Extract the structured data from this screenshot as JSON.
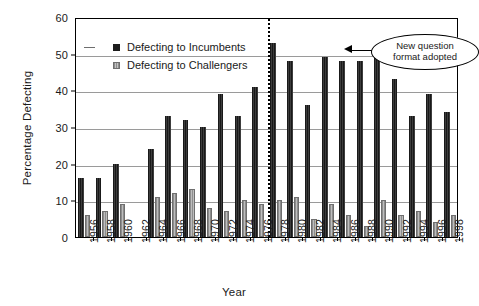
{
  "chart_data": {
    "type": "bar",
    "title": "",
    "xlabel": "Year",
    "ylabel": "Percentage Defecting",
    "ylim": [
      0,
      60
    ],
    "ytick_step": 10,
    "yticks": [
      0,
      10,
      20,
      30,
      40,
      50,
      60
    ],
    "grid": "horizontal",
    "legend_position": "inside-upper-left",
    "categories": [
      "1956",
      "1958",
      "1960",
      "1962",
      "1964",
      "1966",
      "1968",
      "1970",
      "1972",
      "1974",
      "1976",
      "1978",
      "1980",
      "1982",
      "1984",
      "1986",
      "1988",
      "1990",
      "1992",
      "1994",
      "1996",
      "1998"
    ],
    "series": [
      {
        "name": "Defecting to Incumbents",
        "color": "#2b2b2b",
        "values": [
          16,
          16,
          20,
          null,
          24,
          33,
          32,
          30,
          39,
          33,
          41,
          53,
          48,
          36,
          49,
          48,
          48,
          49,
          43,
          33,
          39,
          34
        ]
      },
      {
        "name": "Defecting to Challengers",
        "color": "#a6a6a6",
        "values": [
          6,
          7,
          9,
          null,
          11,
          12,
          13,
          8,
          7,
          10,
          9,
          10,
          11,
          5,
          9,
          6,
          3,
          10,
          6,
          7,
          4,
          6
        ]
      }
    ],
    "annotations": [
      {
        "type": "vertical-line",
        "style": "dotted",
        "between": [
          "1976",
          "1978"
        ],
        "label_lines": [
          "New question",
          "format adopted"
        ]
      }
    ]
  },
  "legend": {
    "items": [
      {
        "label": "Defecting to Incumbents"
      },
      {
        "label": "Defecting to Challengers"
      }
    ]
  },
  "callout": {
    "line1": "New question",
    "line2": "format adopted"
  }
}
